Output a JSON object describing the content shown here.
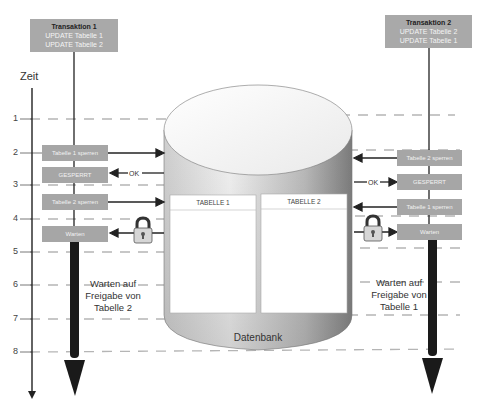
{
  "timeline": {
    "title": "Zeit",
    "ticks": [
      "1",
      "2",
      "3",
      "4",
      "5",
      "6",
      "7",
      "8"
    ]
  },
  "transaction1": {
    "title": "Transaktion 1",
    "lines": [
      "UPDATE Tabelle 1",
      "UPDATE Tabelle 2"
    ],
    "steps": [
      "Tabelle 1 sperren",
      "GESPERRT",
      "Tabelle 2 sperren",
      "Warten"
    ],
    "ok_label": "OK",
    "wait_caption": [
      "Warten auf",
      "Freigabe von",
      "Tabelle 2"
    ]
  },
  "transaction2": {
    "title": "Transaktion 2",
    "lines": [
      "UPDATE Tabelle 2",
      "UPDATE Tabelle 1"
    ],
    "steps": [
      "Tabelle 2 sperren",
      "GESPERRT",
      "Tabelle 1 sperren",
      "Warten"
    ],
    "ok_label": "OK",
    "wait_caption": [
      "Warten auf",
      "Freigabe von",
      "Tabelle 1"
    ]
  },
  "database": {
    "label": "Datenbank",
    "tables": [
      "TABELLE 1",
      "TABELLE 2"
    ]
  },
  "colors": {
    "box_fill": "#a9a9a9",
    "line": "#222222",
    "dash": "#b0b0b0"
  }
}
